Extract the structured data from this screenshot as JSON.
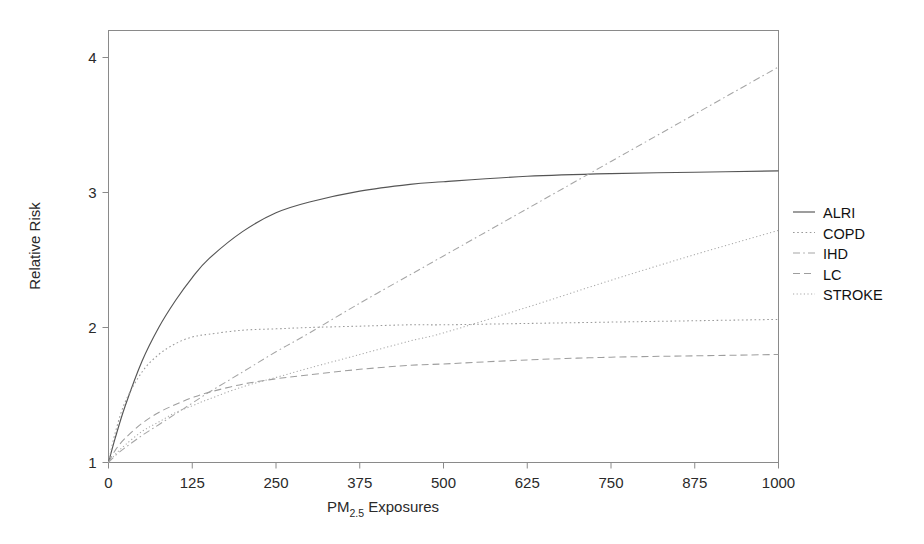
{
  "chart_data": {
    "type": "line",
    "title": "",
    "xlabel": "PM2.5 Exposures",
    "xlabel_main": "PM",
    "xlabel_sub": "2.5",
    "xlabel_tail": " Exposures",
    "ylabel": "Relative Risk",
    "xlim": [
      0,
      1000
    ],
    "ylim": [
      1,
      4.2
    ],
    "xticks": [
      0,
      125,
      250,
      375,
      500,
      625,
      750,
      875,
      1000
    ],
    "xtick_labels": [
      "0",
      "125",
      "250",
      "375",
      "500",
      "625",
      "750",
      "875",
      "1000"
    ],
    "yticks": [
      1,
      2,
      3,
      4
    ],
    "ytick_labels": [
      "1",
      "2",
      "3",
      "4"
    ],
    "grid": false,
    "legend_position": "right",
    "x": [
      0,
      10,
      25,
      50,
      75,
      100,
      125,
      150,
      200,
      250,
      300,
      375,
      450,
      500,
      625,
      750,
      875,
      1000
    ],
    "series": [
      {
        "name": "ALRI",
        "style": "solid",
        "color": "#555555",
        "values": [
          1.0,
          1.18,
          1.42,
          1.75,
          2.0,
          2.2,
          2.37,
          2.51,
          2.71,
          2.85,
          2.93,
          3.01,
          3.06,
          3.08,
          3.12,
          3.14,
          3.15,
          3.16
        ]
      },
      {
        "name": "COPD",
        "style": "dotted",
        "color": "#9a9a9a",
        "values": [
          1.0,
          1.22,
          1.45,
          1.67,
          1.8,
          1.88,
          1.93,
          1.95,
          1.98,
          1.99,
          2.0,
          2.01,
          2.02,
          2.02,
          2.03,
          2.04,
          2.05,
          2.06
        ]
      },
      {
        "name": "IHD",
        "style": "dashdot",
        "color": "#a5a5a5",
        "values": [
          1.0,
          1.05,
          1.11,
          1.2,
          1.28,
          1.36,
          1.44,
          1.52,
          1.67,
          1.82,
          1.96,
          2.18,
          2.39,
          2.53,
          2.88,
          3.23,
          3.58,
          3.93
        ]
      },
      {
        "name": "LC",
        "style": "dashed",
        "color": "#9e9e9e",
        "values": [
          1.0,
          1.09,
          1.18,
          1.29,
          1.37,
          1.43,
          1.48,
          1.52,
          1.58,
          1.62,
          1.65,
          1.69,
          1.72,
          1.73,
          1.76,
          1.78,
          1.79,
          1.8
        ]
      },
      {
        "name": "STROKE",
        "style": "fine-dotted",
        "color": "#a8a8a8",
        "values": [
          1.0,
          1.06,
          1.13,
          1.23,
          1.3,
          1.37,
          1.42,
          1.47,
          1.56,
          1.63,
          1.7,
          1.8,
          1.9,
          1.96,
          2.15,
          2.35,
          2.54,
          2.72
        ]
      }
    ]
  },
  "legend": {
    "entries": [
      {
        "label": "ALRI"
      },
      {
        "label": "COPD"
      },
      {
        "label": "IHD"
      },
      {
        "label": "LC"
      },
      {
        "label": "STROKE"
      }
    ]
  }
}
